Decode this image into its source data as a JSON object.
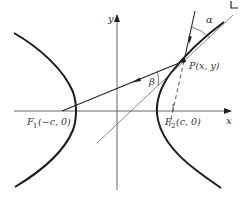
{
  "figure": {
    "type": "hyperbola-reflection-diagram",
    "labels": {
      "x_axis": "x",
      "y_axis": "y",
      "point_p": "P(x, y)",
      "focus_1_prefix": "F",
      "focus_1_sub": "1",
      "focus_1_coords": "(−c, 0)",
      "focus_2_prefix": "F",
      "focus_2_sub": "2",
      "focus_2_coords": "(c, 0)",
      "angle_alpha": "α",
      "angle_beta": "β"
    },
    "colors": {
      "curve": "#1a1a1a",
      "axis": "#444444",
      "text": "#333333"
    }
  }
}
